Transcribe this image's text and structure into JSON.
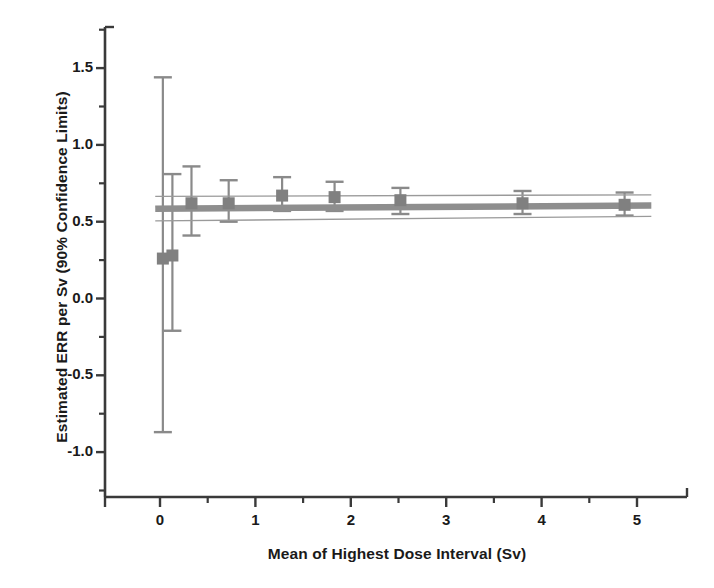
{
  "chart_data": {
    "type": "scatter",
    "title": "",
    "xlabel": "Mean of Highest Dose Interval (Sv)",
    "ylabel": "Estimated ERR per Sv (90% Confidence Limits)",
    "xlim": [
      -0.4,
      5.5
    ],
    "ylim": [
      -1.25,
      1.78
    ],
    "xticks": [
      0,
      1,
      2,
      3,
      4,
      5
    ],
    "xtick_labels": [
      "0",
      "1",
      "2",
      "3",
      "4",
      "5"
    ],
    "xminor_ticks": [
      0.5,
      1.5,
      2.5,
      3.5,
      4.5
    ],
    "yticks": [
      -1.0,
      -0.5,
      0.0,
      0.5,
      1.0,
      1.5
    ],
    "ytick_labels": [
      "-1.0",
      "-0.5",
      "0.0",
      "0.5",
      "1.0",
      "1.5"
    ],
    "yminor_ticks": [
      -1.25,
      -0.75,
      -0.25,
      0.25,
      0.75,
      1.25,
      1.75
    ],
    "grid": false,
    "legend": null,
    "marker": "square",
    "marker_color": "#808080",
    "errorbar_color": "#8a8a8a",
    "fit_line_color": "#9a9a9a",
    "axis_color": "#3a3a3a",
    "points": [
      {
        "x": 0.03,
        "y": 0.26,
        "lo": -0.87,
        "hi": 1.44
      },
      {
        "x": 0.13,
        "y": 0.28,
        "lo": -0.21,
        "hi": 0.81
      },
      {
        "x": 0.33,
        "y": 0.62,
        "lo": 0.41,
        "hi": 0.86
      },
      {
        "x": 0.72,
        "y": 0.62,
        "lo": 0.5,
        "hi": 0.77
      },
      {
        "x": 1.28,
        "y": 0.67,
        "lo": 0.57,
        "hi": 0.79
      },
      {
        "x": 1.83,
        "y": 0.66,
        "lo": 0.57,
        "hi": 0.76
      },
      {
        "x": 2.52,
        "y": 0.64,
        "lo": 0.55,
        "hi": 0.72
      },
      {
        "x": 3.8,
        "y": 0.62,
        "lo": 0.55,
        "hi": 0.7
      },
      {
        "x": 4.87,
        "y": 0.61,
        "lo": 0.54,
        "hi": 0.69
      }
    ],
    "fit_line": {
      "name": "overall estimate",
      "x": [
        -0.05,
        5.15
      ],
      "y": [
        0.585,
        0.605
      ],
      "band_upper_y": [
        0.665,
        0.675
      ],
      "band_lower_y": [
        0.505,
        0.535
      ]
    }
  }
}
